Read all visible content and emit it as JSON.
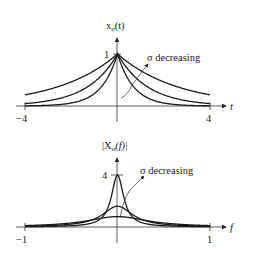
{
  "top_plot": {
    "y_label": "xσ(t)",
    "y_label_main": "x",
    "y_label_sub": "σ",
    "y_label_arg": "(t)",
    "x_axis_label": "t",
    "peak_tick_label": "1",
    "x_min_label": "−4",
    "x_max_label": "4",
    "annotation": "σ decreasing",
    "x_range": [
      -4,
      4
    ],
    "y_peak": 1,
    "sigmas": [
      2.6,
      1.3,
      0.7
    ]
  },
  "bottom_plot": {
    "y_label": "|Xσ(f)|",
    "y_label_main": "|X",
    "y_label_sub": "σ",
    "y_label_arg": "(f)|",
    "x_axis_label": "f",
    "peak_tick_label": "4",
    "x_min_label": "−1",
    "x_max_label": "1",
    "annotation": "σ decreasing",
    "x_range": [
      -1,
      1
    ],
    "y_peak": 4,
    "peaks": [
      4,
      1.6,
      0.8
    ]
  },
  "colors": {
    "line": "#1a1a1a",
    "axis": "#333333",
    "text": "#222222"
  }
}
